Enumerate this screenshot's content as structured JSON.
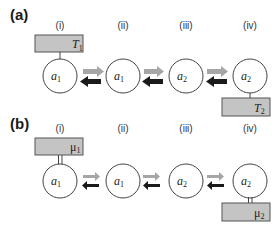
{
  "figure": {
    "panels": [
      {
        "id": "a",
        "label": "(a)",
        "columns": [
          "(i)",
          "(ii)",
          "(iii)",
          "(iv)"
        ],
        "nodes": [
          {
            "symbol": "a",
            "sub": "1"
          },
          {
            "symbol": "a",
            "sub": "1"
          },
          {
            "symbol": "a",
            "sub": "2"
          },
          {
            "symbol": "a",
            "sub": "2"
          }
        ],
        "reservoir_left": {
          "symbol": "T",
          "sub": "1",
          "coupling": "single-line"
        },
        "reservoir_right": {
          "symbol": "T",
          "sub": "2",
          "coupling": "single-line"
        },
        "arrows": {
          "forward": "gray-arrow-right",
          "backward": "black-arrow-left",
          "style": "thick"
        }
      },
      {
        "id": "b",
        "label": "(b)",
        "columns": [
          "(i)",
          "(ii)",
          "(iii)",
          "(iv)"
        ],
        "nodes": [
          {
            "symbol": "a",
            "sub": "1"
          },
          {
            "symbol": "a",
            "sub": "1"
          },
          {
            "symbol": "a",
            "sub": "2"
          },
          {
            "symbol": "a",
            "sub": "2"
          }
        ],
        "reservoir_left": {
          "symbol": "μ",
          "sub": "1",
          "coupling": "double-line"
        },
        "reservoir_right": {
          "symbol": "μ",
          "sub": "2",
          "coupling": "double-line"
        },
        "arrows": {
          "forward": "gray-arrow-right",
          "backward": "black-arrow-left",
          "style": "thin"
        }
      }
    ],
    "colors": {
      "box_fill": "#c4c4c4",
      "box_stroke": "#555555",
      "circle_stroke": "#444444",
      "arrow_forward": "#a6a6a6",
      "arrow_backward": "#1a1a1a"
    }
  }
}
